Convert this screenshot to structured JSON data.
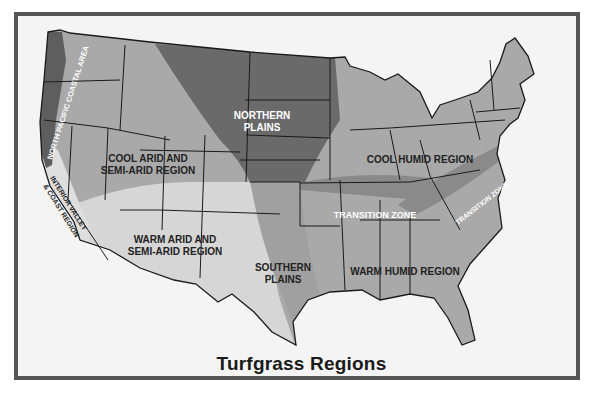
{
  "map": {
    "title": "Turfgrass Regions",
    "caption": "",
    "colors": {
      "frame_border": "#555555",
      "frame_bg": "#f4f4f4",
      "cool_arid": "#a9a9a9",
      "cool_humid": "#a9a9a9",
      "warm_humid": "#a9a9a9",
      "warm_arid": "#d6d6d6",
      "interior_valley": "#dedede",
      "northern_plains": "#6a6a6a",
      "north_pacific": "#5e5e5e",
      "southern_plains": "#a0a0a0",
      "transition_zone": "#8a8a8a",
      "state_lines": "#1a1a1a"
    },
    "regions": [
      {
        "id": "north-pacific-coastal-area",
        "label": "NORTH PACIFIC COASTAL AREA"
      },
      {
        "id": "interior-valley-coast-region",
        "label_line1": "INTERIOR VALLEY",
        "label_line2": "& COAST REGION"
      },
      {
        "id": "cool-arid-semi-arid-region",
        "label_line1": "COOL ARID AND",
        "label_line2": "SEMI-ARID REGION"
      },
      {
        "id": "northern-plains",
        "label_line1": "NORTHERN",
        "label_line2": "PLAINS"
      },
      {
        "id": "cool-humid-region",
        "label": "COOL HUMID REGION"
      },
      {
        "id": "transition-zone-central",
        "label": "TRANSITION ZONE"
      },
      {
        "id": "transition-zone-appalachian",
        "label": "TRANSITION ZONE"
      },
      {
        "id": "warm-arid-semi-arid-region",
        "label_line1": "WARM ARID AND",
        "label_line2": "SEMI-ARID REGION"
      },
      {
        "id": "southern-plains",
        "label_line1": "SOUTHERN",
        "label_line2": "PLAINS"
      },
      {
        "id": "warm-humid-region",
        "label": "WARM HUMID REGION"
      }
    ]
  }
}
